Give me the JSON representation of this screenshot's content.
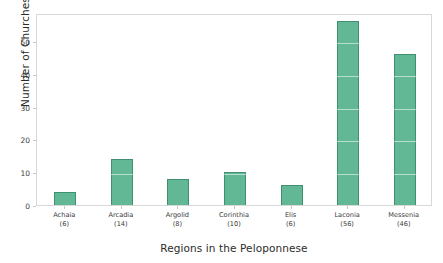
{
  "chart_data": {
    "type": "bar",
    "title": "",
    "xlabel": "Regions in the Peloponnese",
    "ylabel": "Number of Churches",
    "categories": [
      "Achaia",
      "Arcadia",
      "Argolid",
      "Corinthia",
      "Elis",
      "Laconia",
      "Messenia"
    ],
    "values": [
      4,
      14,
      8,
      10,
      6,
      56,
      46
    ],
    "tick_counts": [
      "(6)",
      "(14)",
      "(8)",
      "(10)",
      "(6)",
      "(56)",
      "(46)"
    ],
    "tick_labels": [
      "Achaia\n(6)",
      "Arcadia\n(14)",
      "Argolid\n(8)",
      "Corinthia\n(10)",
      "Elis\n(6)",
      "Laconia\n(56)",
      "Messenia\n(46)"
    ],
    "ylim": [
      0,
      58.5
    ],
    "yticks": [
      0,
      10,
      20,
      30,
      40,
      50
    ],
    "ytick_labels": [
      "0",
      "10",
      "20",
      "30",
      "40",
      "50"
    ],
    "grid": "horizontal-faint",
    "legend": "none",
    "bar_color": "#62b795",
    "bar_edge_color": "#3f8f70",
    "axes_frame_color": "#d8d8d8",
    "background_color": "#ffffff",
    "text_color": "#2b2b2b"
  }
}
